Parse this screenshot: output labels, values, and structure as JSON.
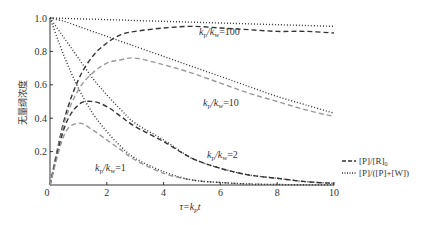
{
  "chart_data": {
    "type": "line",
    "title": "",
    "xlabel": "τ=k_p t",
    "ylabel": "无量纲浓度",
    "xlim": [
      0,
      10
    ],
    "ylim": [
      0,
      1.0
    ],
    "xticks": [
      "0",
      "2",
      "4",
      "6",
      "8",
      "10"
    ],
    "yticks": [
      "0.2",
      "0.4",
      "0.6",
      "0.8",
      "1.0"
    ],
    "grid": false,
    "legend_position": "right",
    "legend": [
      {
        "style": "dashed",
        "label": "[P]/[R]₀"
      },
      {
        "style": "dotted",
        "label": "[P]/([P]+[W])"
      }
    ],
    "annotations": [
      {
        "text": "k_p/k_w=100",
        "x": 5.5,
        "y": 0.88
      },
      {
        "text": "k_p/k_w=10",
        "x": 5.6,
        "y": 0.46
      },
      {
        "text": "k_p/k_w=2",
        "x": 5.5,
        "y": 0.17
      },
      {
        "text": "k_p/k_w=1",
        "x": 2.0,
        "y": 0.1
      }
    ],
    "x": [
      0,
      0.5,
      1,
      1.5,
      2,
      2.5,
      3,
      4,
      5,
      6,
      7,
      8,
      9,
      10
    ],
    "series": [
      {
        "name": "[P]/[R]0, kp/kw=100",
        "style": "dashed",
        "color": "#333333",
        "values": [
          0,
          0.39,
          0.63,
          0.77,
          0.85,
          0.9,
          0.92,
          0.94,
          0.95,
          0.94,
          0.93,
          0.92,
          0.92,
          0.91
        ]
      },
      {
        "name": "[P]/[R]0, kp/kw=10",
        "style": "dashed",
        "color": "#999999",
        "values": [
          0,
          0.37,
          0.57,
          0.67,
          0.73,
          0.75,
          0.76,
          0.72,
          0.67,
          0.61,
          0.55,
          0.5,
          0.45,
          0.41
        ]
      },
      {
        "name": "[P]/[R]0, kp/kw=2",
        "style": "dashed",
        "color": "#333333",
        "values": [
          0,
          0.34,
          0.48,
          0.5,
          0.47,
          0.41,
          0.35,
          0.26,
          0.16,
          0.1,
          0.06,
          0.04,
          0.02,
          0.01
        ]
      },
      {
        "name": "[P]/[R]0, kp/kw=1",
        "style": "dashed",
        "color": "#999999",
        "values": [
          0,
          0.3,
          0.37,
          0.33,
          0.27,
          0.21,
          0.15,
          0.07,
          0.03,
          0.015,
          0.006,
          0.003,
          0.001,
          0.0005
        ]
      },
      {
        "name": "[P]/([P]+[W]), kp/kw=100",
        "style": "dotted",
        "color": "#333333",
        "values": [
          1.0,
          0.998,
          0.995,
          0.993,
          0.99,
          0.988,
          0.985,
          0.98,
          0.975,
          0.97,
          0.965,
          0.96,
          0.955,
          0.95
        ]
      },
      {
        "name": "[P]/([P]+[W]), kp/kw=10",
        "style": "dotted",
        "color": "#333333",
        "values": [
          1.0,
          0.98,
          0.95,
          0.92,
          0.89,
          0.86,
          0.83,
          0.77,
          0.71,
          0.65,
          0.59,
          0.53,
          0.48,
          0.43
        ]
      },
      {
        "name": "[P]/([P]+[W]), kp/kw=2",
        "style": "dotted",
        "color": "#333333",
        "values": [
          1.0,
          0.88,
          0.76,
          0.64,
          0.54,
          0.45,
          0.37,
          0.27,
          0.16,
          0.1,
          0.06,
          0.04,
          0.02,
          0.01
        ]
      },
      {
        "name": "[P]/([P]+[W]), kp/kw=1",
        "style": "dotted",
        "color": "#333333",
        "values": [
          1.0,
          0.77,
          0.58,
          0.43,
          0.32,
          0.23,
          0.16,
          0.08,
          0.03,
          0.015,
          0.006,
          0.003,
          0.001,
          0.0005
        ]
      }
    ]
  },
  "axis_labels": {
    "x_prefix": "τ=k",
    "x_sub": "p",
    "x_suffix": "t",
    "y": "无量纲浓度"
  },
  "curve_labels": {
    "k100": {
      "pre": "k",
      "sub1": "p",
      "mid": "/k",
      "sub2": "w",
      "post": "=100"
    },
    "k10": {
      "pre": "k",
      "sub1": "p",
      "mid": "/k",
      "sub2": "w",
      "post": "=10"
    },
    "k2": {
      "pre": "k",
      "sub1": "p",
      "mid": "/k",
      "sub2": "w",
      "post": "=2"
    },
    "k1": {
      "pre": "k",
      "sub1": "p",
      "mid": "/k",
      "sub2": "w",
      "post": "=1"
    }
  },
  "legend": {
    "dashed_label": "[P]/[R]",
    "dashed_sub": "0",
    "dotted_label": "[P]/([P]+[W])"
  }
}
